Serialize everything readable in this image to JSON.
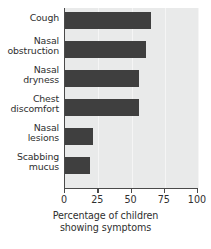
{
  "chart_data": {
    "type": "bar",
    "orientation": "horizontal",
    "title": "",
    "xlabel": "Percentage of children showing symptoms",
    "ylabel": "",
    "xlim": [
      0,
      100
    ],
    "xticks": [
      0,
      25,
      50,
      75,
      100
    ],
    "xtick_labels": [
      "0",
      "25",
      "50",
      "75",
      "100"
    ],
    "grid": true,
    "legend": "none",
    "categories": [
      "Cough",
      "Nasal obstruction",
      "Nasal dryness",
      "Chest discomfort",
      "Nasal lesions",
      "Scabbing mucus"
    ],
    "values": [
      65,
      61,
      56,
      56,
      21,
      19
    ],
    "bar_color": "#3f3f3f",
    "plot_background": "#e9eaea",
    "axis_color": "#4a4a4a"
  },
  "axis_title": {
    "line1": "Percentage of children",
    "line2": "showing symptoms"
  },
  "categories": [
    {
      "line1": "Cough",
      "line2": ""
    },
    {
      "line1": "Nasal",
      "line2": "obstruction"
    },
    {
      "line1": "Nasal",
      "line2": "dryness"
    },
    {
      "line1": "Chest",
      "line2": "discomfort"
    },
    {
      "line1": "Nasal",
      "line2": "lesions"
    },
    {
      "line1": "Scabbing",
      "line2": "mucus"
    }
  ],
  "ticks": [
    {
      "label": "0"
    },
    {
      "label": "25"
    },
    {
      "label": "50"
    },
    {
      "label": "75"
    },
    {
      "label": "100"
    }
  ]
}
